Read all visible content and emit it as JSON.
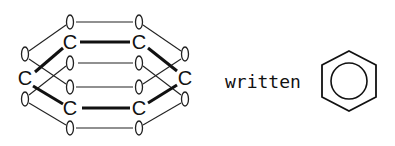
{
  "diagram": {
    "atom_label": "C",
    "connector_label": "written",
    "carbons": [
      {
        "id": "c1",
        "x": 70,
        "y": 42
      },
      {
        "id": "c2",
        "x": 139,
        "y": 42
      },
      {
        "id": "c3",
        "x": 185,
        "y": 78
      },
      {
        "id": "c4",
        "x": 139,
        "y": 108
      },
      {
        "id": "c5",
        "x": 70,
        "y": 108
      },
      {
        "id": "c6",
        "x": 25,
        "y": 78
      }
    ],
    "p_orbitals": [
      {
        "x": 70,
        "y": 22
      },
      {
        "x": 139,
        "y": 22
      },
      {
        "x": 70,
        "y": 63
      },
      {
        "x": 139,
        "y": 63
      },
      {
        "x": 70,
        "y": 87
      },
      {
        "x": 139,
        "y": 87
      },
      {
        "x": 70,
        "y": 128
      },
      {
        "x": 139,
        "y": 128
      },
      {
        "x": 25,
        "y": 54
      },
      {
        "x": 25,
        "y": 99
      },
      {
        "x": 185,
        "y": 54
      },
      {
        "x": 185,
        "y": 99
      }
    ],
    "symbol": {
      "shape": "hexagon-with-inscribed-circle",
      "center": [
        349,
        81
      ],
      "circle_radius": 18
    },
    "colors": {
      "ink": "#111111",
      "background": "#ffffff"
    }
  }
}
